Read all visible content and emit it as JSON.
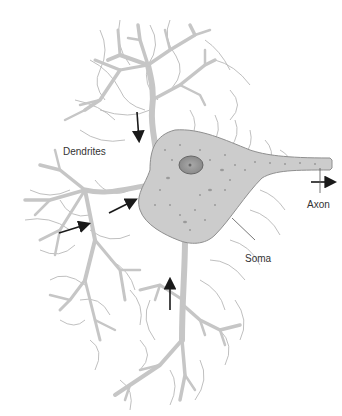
{
  "diagram": {
    "labels": {
      "dendrites": "Dendrites",
      "axon": "Axon",
      "soma": "Soma"
    },
    "colors": {
      "cell_fill": "#c8c8c8",
      "cell_stroke": "#8c8c8c",
      "hair": "#b4b4b4",
      "nucleus_fill": "#9a9a9a",
      "arrow": "#1a1a1a",
      "label_text": "#333333"
    },
    "arrows": [
      {
        "id": "top-dendrite-arrow",
        "direction": "down"
      },
      {
        "id": "left-dendrite-arrow-1",
        "direction": "right"
      },
      {
        "id": "left-dendrite-arrow-2",
        "direction": "right"
      },
      {
        "id": "bottom-dendrite-arrow",
        "direction": "up"
      },
      {
        "id": "axon-arrow",
        "direction": "right"
      }
    ]
  }
}
